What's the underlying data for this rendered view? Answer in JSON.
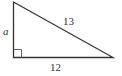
{
  "diagram": {
    "type": "right-triangle",
    "labels": {
      "hypotenuse": "13",
      "base": "12",
      "leg": "a"
    },
    "right_angle_marker": true,
    "stroke_color": "#333333"
  }
}
